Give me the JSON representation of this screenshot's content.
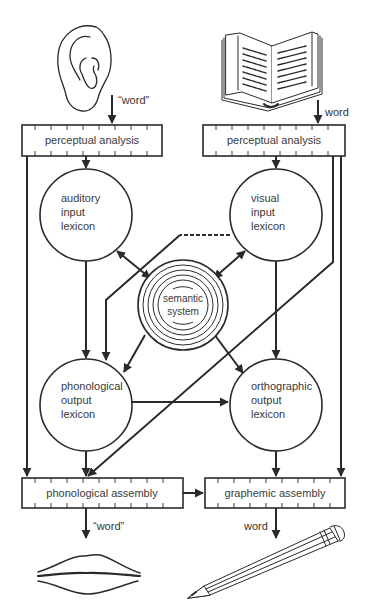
{
  "diagram": {
    "type": "cognitive-model-flow",
    "inputs": {
      "auditory": {
        "icon": "ear-icon",
        "label": "“word”"
      },
      "visual": {
        "icon": "open-book-icon",
        "label": "word"
      }
    },
    "outputs": {
      "speech": {
        "icon": "lips-icon",
        "label": "“word”"
      },
      "writing": {
        "icon": "pencil-icon",
        "label": "word"
      }
    },
    "boxes": {
      "perceptual_left": "perceptual analysis",
      "perceptual_right": "perceptual analysis",
      "phonological_assembly": "phonological assembly",
      "graphemic_assembly": "graphemic assembly"
    },
    "nodes": {
      "auditory_input_lexicon": [
        "auditory",
        "input",
        "lexicon"
      ],
      "visual_input_lexicon": [
        "visual",
        "input",
        "lexicon"
      ],
      "semantic_system": [
        "semantic",
        "system"
      ],
      "phonological_output_lexicon": [
        "phonological",
        "output",
        "lexicon"
      ],
      "orthographic_output_lexicon": [
        "orthographic",
        "output",
        "lexicon"
      ]
    },
    "edges": [
      {
        "from": "perceptual analysis (auditory)",
        "to": "auditory input lexicon",
        "style": "solid"
      },
      {
        "from": "perceptual analysis (auditory)",
        "to": "phonological assembly",
        "style": "solid"
      },
      {
        "from": "perceptual analysis (visual)",
        "to": "visual input lexicon",
        "style": "solid"
      },
      {
        "from": "perceptual analysis (visual)",
        "to": "graphemic assembly",
        "style": "solid"
      },
      {
        "from": "perceptual analysis (visual)",
        "to": "phonological assembly",
        "style": "solid"
      },
      {
        "from": "auditory input lexicon",
        "to": "semantic system",
        "style": "bidirectional"
      },
      {
        "from": "visual input lexicon",
        "to": "semantic system",
        "style": "bidirectional"
      },
      {
        "from": "visual input lexicon",
        "to": "phonological output lexicon",
        "style": "dashed-then-solid"
      },
      {
        "from": "auditory input lexicon",
        "to": "phonological output lexicon",
        "style": "solid"
      },
      {
        "from": "visual input lexicon",
        "to": "orthographic output lexicon",
        "style": "solid"
      },
      {
        "from": "semantic system",
        "to": "phonological output lexicon",
        "style": "solid"
      },
      {
        "from": "semantic system",
        "to": "orthographic output lexicon",
        "style": "solid"
      },
      {
        "from": "phonological output lexicon",
        "to": "orthographic output lexicon",
        "style": "solid"
      },
      {
        "from": "phonological output lexicon",
        "to": "phonological assembly",
        "style": "solid"
      },
      {
        "from": "orthographic output lexicon",
        "to": "graphemic assembly",
        "style": "solid"
      },
      {
        "from": "phonological assembly",
        "to": "graphemic assembly",
        "style": "solid"
      }
    ]
  }
}
